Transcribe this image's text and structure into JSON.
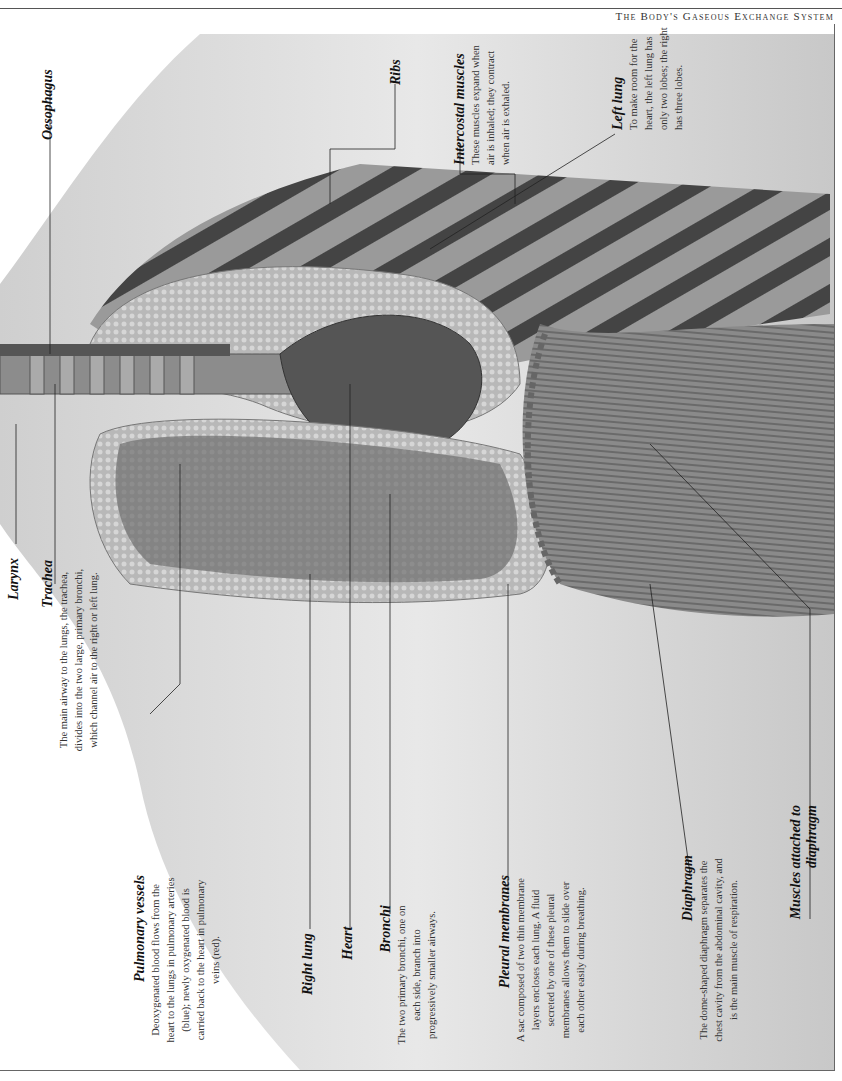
{
  "page": {
    "running_head": "The Body's Gaseous Exchange System"
  },
  "labels": {
    "oesophagus": {
      "title": "Oesophagus"
    },
    "larynx": {
      "title": "Larynx"
    },
    "trachea": {
      "title": "Trachea",
      "text": "The main airway to the lungs, the trachea, divides into the two large, primary bronchi, which channel air to the right or left lung."
    },
    "ribs": {
      "title": "Ribs"
    },
    "intercostal": {
      "title": "Intercostal muscles",
      "text": "These muscles expand when air is inhaled; they contract when air is exhaled."
    },
    "left_lung": {
      "title": "Left lung",
      "text": "To make room for the heart, the left lung has only two lobes; the right has three lobes."
    },
    "pulmonary": {
      "title": "Pulmonary vessels",
      "text": "Deoxygenated blood flows from the heart to the lungs in pulmonary arteries (blue); newly oxygenated blood is carried back to the heart in pulmonary veins (red)."
    },
    "right_lung": {
      "title": "Right lung"
    },
    "heart": {
      "title": "Heart"
    },
    "bronchi": {
      "title": "Bronchi",
      "text": "The two primary bronchi, one on each side, branch into progressively smaller airways."
    },
    "pleural": {
      "title": "Pleural membranes",
      "text": "A sac composed of two thin membrane layers encloses each lung. A fluid secreted by one of these pleural membranes allows them to slide over each other easily during breathing."
    },
    "diaphragm": {
      "title": "Diaphragm",
      "text": "The dome-shaped diaphragm separates the chest cavity from the abdominal cavity, and is the main muscle of respiration."
    },
    "muscles_diaphragm": {
      "title": "Muscles attached to diaphragm"
    }
  },
  "colors": {
    "ink": "#222222",
    "rule": "#555555",
    "skin": "#d9d9d9",
    "lung": "#bdbdbd",
    "dark": "#555555"
  }
}
